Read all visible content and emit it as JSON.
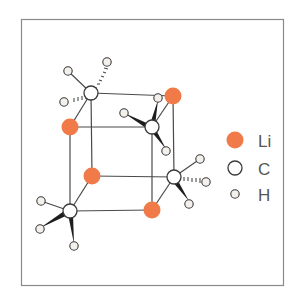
{
  "diagram": {
    "type": "molecular-structure",
    "colors": {
      "frame": "#8a8a8a",
      "bond": "#4a4a4a",
      "lithium": "#f07a48",
      "carbon_fill": "#ffffff",
      "carbon_stroke": "#3a3a3a",
      "hydrogen_fill": "#f4f0ec",
      "hydrogen_stroke": "#3a3a3a"
    },
    "legend": {
      "items": [
        {
          "symbol": "lithium",
          "label": "Li"
        },
        {
          "symbol": "carbon",
          "label": "C"
        },
        {
          "symbol": "hydrogen",
          "label": "H"
        }
      ]
    }
  }
}
